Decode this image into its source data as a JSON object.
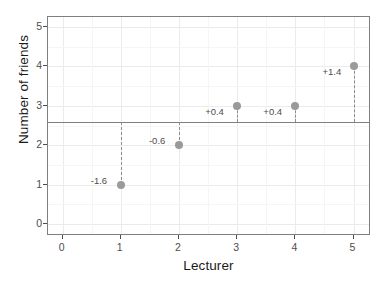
{
  "chart_data": {
    "type": "scatter",
    "title": "",
    "xlabel": "Lecturer",
    "ylabel": "Number of friends",
    "x": [
      1,
      2,
      3,
      4,
      5
    ],
    "values": [
      1,
      2,
      3,
      3,
      4
    ],
    "series": [
      {
        "name": "Number of friends",
        "values": [
          1,
          2,
          3,
          3,
          4
        ]
      }
    ],
    "xlim": [
      -0.25,
      5.3
    ],
    "ylim": [
      -0.3,
      5.25
    ],
    "xticks": [
      "0",
      "1",
      "2",
      "3",
      "4",
      "5"
    ],
    "yticks": [
      "0",
      "1",
      "2",
      "3",
      "4",
      "5"
    ],
    "xtick_values": [
      0,
      1,
      2,
      3,
      4,
      5
    ],
    "ytick_values": [
      0,
      1,
      2,
      3,
      4,
      5
    ],
    "grid": true,
    "legend": "none",
    "reference_line": {
      "name": "mean",
      "value": 2.6,
      "orientation": "horizontal"
    },
    "annotations": [
      {
        "label": "-1.6",
        "x": 1,
        "value": -1.6
      },
      {
        "label": "-0.6",
        "x": 2,
        "value": -0.6
      },
      {
        "label": "+0.4",
        "x": 3,
        "value": 0.4
      },
      {
        "label": "+0.4",
        "x": 4,
        "value": 0.4
      },
      {
        "label": "+1.4",
        "x": 5,
        "value": 1.4
      }
    ],
    "colors": {
      "point": "#9a9a9a",
      "residual_line": "#8c8c8c",
      "reference_line": "#808080",
      "panel_border": "#7f7f7f",
      "grid_major": "#ebebeb",
      "grid_minor": "#f5f5f5",
      "text": "#4d4d4d",
      "axis_title": "#1a1a1a",
      "background": "#ffffff"
    }
  }
}
